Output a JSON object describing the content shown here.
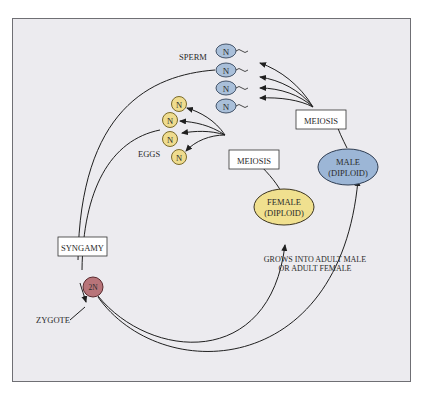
{
  "diagram": {
    "colors": {
      "panel_fill": "#ecebef",
      "panel_border": "#6f6f74",
      "sperm_fill": "#a9bfd9",
      "sperm_stroke": "#44546a",
      "egg_fill": "#efdc8e",
      "egg_stroke": "#7a6a2a",
      "male_fill": "#9cb6d6",
      "female_fill": "#f0e08f",
      "zygote_fill": "#b87479",
      "line": "#1f1f1f"
    },
    "labels": {
      "sperm": "SPERM",
      "eggs": "EGGS",
      "meiosis_male": "MEIOSIS",
      "meiosis_female": "MEIOSIS",
      "syngamy": "SYNGAMY",
      "zygote": "ZYGOTE",
      "grows_line1": "GROWS INTO ADULT MALE",
      "grows_line2": "OR ADULT FEMALE"
    },
    "male": {
      "line1": "MALE",
      "line2": "(DIPLOID)"
    },
    "female": {
      "line1": "FEMALE",
      "line2": "(DIPLOID)"
    },
    "zygote_ploidy": "2N",
    "sperm_cells": [
      {
        "ploidy": "N"
      },
      {
        "ploidy": "N"
      },
      {
        "ploidy": "N"
      },
      {
        "ploidy": "N"
      }
    ],
    "egg_cells": [
      {
        "ploidy": "N"
      },
      {
        "ploidy": "N"
      },
      {
        "ploidy": "N"
      },
      {
        "ploidy": "N"
      }
    ]
  }
}
